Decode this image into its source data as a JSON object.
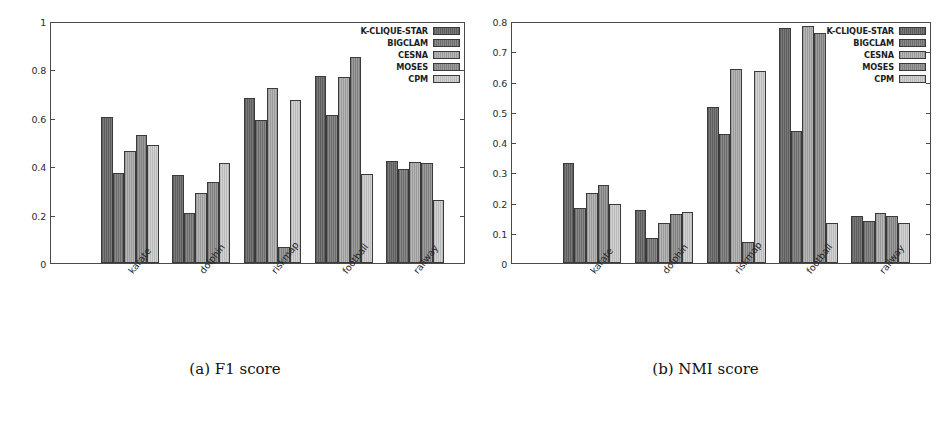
{
  "figure": {
    "panels": [
      {
        "id": "panel-a",
        "caption": "(a) F1 score",
        "chart_ref": 0
      },
      {
        "id": "panel-b",
        "caption": "(b) NMI score",
        "chart_ref": 1
      }
    ]
  },
  "chart_data": [
    {
      "type": "bar",
      "title": "(a) F1 score",
      "xlabel": "",
      "ylabel": "",
      "ylim": [
        0,
        1
      ],
      "yticks": [
        0,
        0.2,
        0.4,
        0.6,
        0.8,
        1
      ],
      "ytick_labels": [
        "0",
        "0.2",
        "0.4",
        "0.6",
        "0.8",
        "1"
      ],
      "grid": false,
      "legend_position": "top-right",
      "categories": [
        "karate",
        "dolphin",
        "riskmap",
        "football",
        "railway"
      ],
      "series": [
        {
          "name": "K-CLIQUE-STAR",
          "color": "#6f6f6f",
          "values": [
            0.605,
            0.364,
            0.683,
            0.771,
            0.421
          ]
        },
        {
          "name": "BIGCLAM",
          "color": "#7d7d7d",
          "values": [
            0.372,
            0.206,
            0.592,
            0.61,
            0.388
          ]
        },
        {
          "name": "CESNA",
          "color": "#a9a9a9",
          "values": [
            0.461,
            0.29,
            0.722,
            0.769,
            0.417
          ]
        },
        {
          "name": "MOSES",
          "color": "#8e8e8e",
          "values": [
            0.53,
            0.334,
            0.067,
            0.853,
            0.414
          ]
        },
        {
          "name": "CPM",
          "color": "#c6c6c6",
          "values": [
            0.486,
            0.414,
            0.675,
            0.366,
            0.262
          ]
        }
      ]
    },
    {
      "type": "bar",
      "title": "(b) NMI score",
      "xlabel": "",
      "ylabel": "",
      "ylim": [
        0,
        0.8
      ],
      "yticks": [
        0,
        0.1,
        0.2,
        0.3,
        0.4,
        0.5,
        0.6,
        0.7,
        0.8
      ],
      "ytick_labels": [
        "0",
        "0.1",
        "0.2",
        "0.3",
        "0.4",
        "0.5",
        "0.6",
        "0.7",
        "0.8"
      ],
      "grid": false,
      "legend_position": "top-right",
      "categories": [
        "karate",
        "dolphin",
        "riskmap",
        "football",
        "railway"
      ],
      "series": [
        {
          "name": "K-CLIQUE-STAR",
          "color": "#6f6f6f",
          "values": [
            0.33,
            0.175,
            0.517,
            0.777,
            0.155
          ]
        },
        {
          "name": "BIGCLAM",
          "color": "#7d7d7d",
          "values": [
            0.183,
            0.082,
            0.428,
            0.437,
            0.139
          ]
        },
        {
          "name": "CESNA",
          "color": "#a9a9a9",
          "values": [
            0.231,
            0.131,
            0.643,
            0.782,
            0.166
          ]
        },
        {
          "name": "MOSES",
          "color": "#8e8e8e",
          "values": [
            0.257,
            0.161,
            0.068,
            0.761,
            0.157
          ]
        },
        {
          "name": "CPM",
          "color": "#c6c6c6",
          "values": [
            0.195,
            0.167,
            0.635,
            0.133,
            0.133
          ]
        }
      ]
    }
  ]
}
